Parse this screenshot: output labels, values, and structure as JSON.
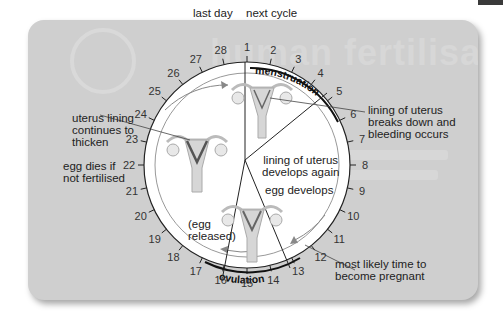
{
  "background": {
    "watermark_title": "human fertilisation",
    "watermark_number": "5"
  },
  "diagram": {
    "colors": {
      "panel": "#cfcfcf",
      "ring": "#ffffff",
      "ink": "#222222",
      "tissue": "#c9c9c9",
      "lining": "#6b6b6b"
    },
    "top_labels": {
      "last_day": "last day",
      "next_cycle": "next cycle"
    },
    "days": [
      "1",
      "2",
      "3",
      "4",
      "5",
      "6",
      "7",
      "8",
      "9",
      "10",
      "11",
      "12",
      "13",
      "14",
      "15",
      "16",
      "17",
      "18",
      "19",
      "20",
      "21",
      "22",
      "23",
      "24",
      "25",
      "26",
      "27",
      "28"
    ],
    "arc_labels": {
      "menstruation": "menstruation",
      "ovulation": "ovulation"
    },
    "annotations": {
      "lining_breaks_down": [
        "lining of uterus",
        "breaks down and",
        "bleeding occurs"
      ],
      "lining_develops": [
        "lining of uterus",
        "develops again"
      ],
      "egg_develops": "egg develops",
      "egg_released": [
        "(egg",
        "released)"
      ],
      "most_likely": [
        "most likely time to",
        "become pregnant"
      ],
      "lining_thickens": [
        "uterus lining",
        "continues to",
        "thicken"
      ],
      "egg_dies": [
        "egg dies if",
        "not fertilised"
      ]
    }
  }
}
